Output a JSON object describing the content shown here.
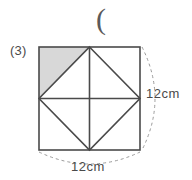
{
  "figure": {
    "item_number": "(3)",
    "stray_mark": "(",
    "colors": {
      "outline": "#4a4a4a",
      "shade": "#d8d8d8",
      "dash": "#9a9a9a",
      "text": "#4a4a4a",
      "background": "#ffffff"
    },
    "square": {
      "name": "outer-square",
      "x": 39,
      "y": 47,
      "width": 101,
      "height": 103,
      "side_length_cm": 12
    },
    "inscribed_diamond": {
      "name": "inscribed-rhombus",
      "vertices": [
        {
          "label": "top-midpoint",
          "x": 89.5,
          "y": 47
        },
        {
          "label": "right-midpoint",
          "x": 140,
          "y": 98.5
        },
        {
          "label": "bottom-midpoint",
          "x": 89.5,
          "y": 150
        },
        {
          "label": "left-midpoint",
          "x": 39,
          "y": 98.5
        }
      ]
    },
    "center_lines": [
      {
        "name": "vertical-centerline",
        "x1": 89.5,
        "y1": 47,
        "x2": 89.5,
        "y2": 150
      },
      {
        "name": "horizontal-centerline",
        "x1": 39,
        "y1": 98.5,
        "x2": 140,
        "y2": 98.5
      }
    ],
    "shaded_triangle": {
      "name": "shaded-corner-triangle",
      "position": "top-left",
      "points": "39,47 89.5,47 39,98.5"
    },
    "dimension_labels": [
      {
        "id": "bottom",
        "text": "12cm",
        "orientation": "horizontal"
      },
      {
        "id": "right",
        "text": "12cm",
        "orientation": "vertical"
      }
    ],
    "arcs": {
      "bottom": {
        "name": "bottom-dimension-arc",
        "path": "M 39,152 Q 89.5,176 140,152"
      },
      "right": {
        "name": "right-dimension-arc",
        "path": "M 142,47 Q 168,98.5 142,150"
      }
    }
  }
}
